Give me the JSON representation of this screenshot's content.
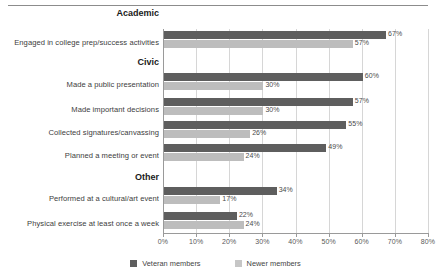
{
  "chart_data": {
    "type": "bar",
    "orientation": "horizontal",
    "title": "",
    "xlabel": "",
    "ylabel": "",
    "xlim": [
      0,
      80
    ],
    "xticks": [
      "0%",
      "10%",
      "20%",
      "30%",
      "40%",
      "50%",
      "60%",
      "70%",
      "80%"
    ],
    "xtick_values": [
      0,
      10,
      20,
      30,
      40,
      50,
      60,
      70,
      80
    ],
    "grid": "vertical",
    "legend_position": "bottom-center",
    "series": [
      {
        "name": "Veteran members",
        "color": "#5e5e5e",
        "values": [
          67,
          60,
          57,
          55,
          49,
          34,
          22
        ]
      },
      {
        "name": "Newer members",
        "color": "#bdbdbd",
        "values": [
          57,
          30,
          30,
          26,
          24,
          17,
          24
        ]
      }
    ],
    "categories": [
      "Engaged in college prep/success activities",
      "Made a public presentation",
      "Made important decisions",
      "Collected signatures/canvassing",
      "Planned a meeting or event",
      "Performed at a cultural/art event",
      "Physical exercise at least once a week"
    ],
    "sections": [
      {
        "heading": "Academic",
        "rows": [
          0
        ]
      },
      {
        "heading": "Civic",
        "rows": [
          1,
          2,
          3,
          4
        ]
      },
      {
        "heading": "Other",
        "rows": [
          5,
          6
        ]
      }
    ],
    "data_labels": [
      {
        "veteran": "67%",
        "newer": "57%"
      },
      {
        "veteran": "60%",
        "newer": "30%"
      },
      {
        "veteran": "57%",
        "newer": "30%"
      },
      {
        "veteran": "55%",
        "newer": "26%"
      },
      {
        "veteran": "49%",
        "newer": "24%"
      },
      {
        "veteran": "34%",
        "newer": "17%"
      },
      {
        "veteran": "22%",
        "newer": "24%"
      }
    ]
  },
  "sections": [
    {
      "heading": "Academic",
      "top": 8
    },
    {
      "heading": "Civic",
      "top": 57
    },
    {
      "heading": "Other",
      "top": 172
    }
  ],
  "rows": [
    {
      "label": "Engaged in college prep/success activities",
      "label_top": 38,
      "veteran_top": 31,
      "newer_top": 40,
      "veteran_value": "67%",
      "newer_value": "57%",
      "veteran_pct": 67,
      "newer_pct": 57
    },
    {
      "label": "Made a public presentation",
      "label_top": 80,
      "veteran_top": 73,
      "newer_top": 82,
      "veteran_value": "60%",
      "newer_value": "30%",
      "veteran_pct": 60,
      "newer_pct": 30
    },
    {
      "label": "Made important decisions",
      "label_top": 105,
      "veteran_top": 98,
      "newer_top": 107,
      "veteran_value": "57%",
      "newer_value": "30%",
      "veteran_pct": 57,
      "newer_pct": 30
    },
    {
      "label": "Collected signatures/canvassing",
      "label_top": 128,
      "veteran_top": 121,
      "newer_top": 130,
      "veteran_value": "55%",
      "newer_value": "26%",
      "veteran_pct": 55,
      "newer_pct": 26
    },
    {
      "label": "Planned a meeting or event",
      "label_top": 151,
      "veteran_top": 144,
      "newer_top": 153,
      "veteran_value": "49%",
      "newer_value": "24%",
      "veteran_pct": 49,
      "newer_pct": 24
    },
    {
      "label": "Performed at a cultural/art event",
      "label_top": 194,
      "veteran_top": 187,
      "newer_top": 196,
      "veteran_value": "34%",
      "newer_value": "17%",
      "veteran_pct": 34,
      "newer_pct": 17
    },
    {
      "label": "Physical exercise at least once a week",
      "label_top": 219,
      "veteran_top": 212,
      "newer_top": 221,
      "veteran_value": "22%",
      "newer_value": "24%",
      "veteran_pct": 22,
      "newer_pct": 24
    }
  ],
  "xaxis": {
    "ticks": [
      {
        "label": "0%",
        "value": 0
      },
      {
        "label": "10%",
        "value": 10
      },
      {
        "label": "20%",
        "value": 20
      },
      {
        "label": "30%",
        "value": 30
      },
      {
        "label": "40%",
        "value": 40
      },
      {
        "label": "50%",
        "value": 50
      },
      {
        "label": "60%",
        "value": 60
      },
      {
        "label": "70%",
        "value": 70
      },
      {
        "label": "80%",
        "value": 80
      }
    ]
  },
  "legend": {
    "items": [
      {
        "label": "Veteran members",
        "color": "#5e5e5e"
      },
      {
        "label": "Newer members",
        "color": "#c6c6c6"
      }
    ]
  }
}
